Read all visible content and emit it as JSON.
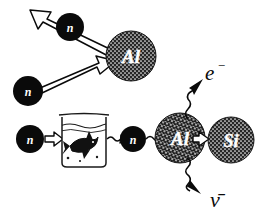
{
  "figure": {
    "background_color": "#ffffff",
    "ink_color": "#0a0a0a"
  },
  "palette": {
    "neutron_fill": "#0a0a0a",
    "neutron_label_color": "#ffffff",
    "nucleus_fill": "#2b2b2b",
    "nucleus_label_color": "#ffffff",
    "outline_arrow_fill": "#ffffff",
    "outline_arrow_stroke": "#0a0a0a",
    "wavy_arrow_color": "#0a0a0a",
    "beaker_stroke": "#1a1a1a"
  },
  "top_row": {
    "caption": "Neutron scattering off an aluminium nucleus",
    "incoming_neutron": {
      "label": "n",
      "x": 28,
      "y": 91,
      "r": 15
    },
    "outgoing_neutron": {
      "label": "n",
      "x": 70,
      "y": 27,
      "r": 14
    },
    "nucleus": {
      "label": "Al",
      "x": 131,
      "y": 56,
      "r": 25
    },
    "incoming_arrow": {
      "name": "neutron-in-arrow",
      "direction": "up-right"
    },
    "outgoing_arrow": {
      "name": "neutron-out-arrow",
      "direction": "up-left"
    }
  },
  "bottom_row": {
    "caption": "Moderated neutron captured by aluminium, beta decay to silicon",
    "source_neutron": {
      "label": "n",
      "x": 30,
      "y": 139,
      "r": 14
    },
    "moderated_neutron": {
      "label": "n",
      "x": 133,
      "y": 139,
      "r": 13
    },
    "moderator": {
      "name": "water-beaker",
      "label": "",
      "x": 60,
      "y": 113,
      "w": 48,
      "h": 55
    },
    "nucleus_before": {
      "label": "Al",
      "x": 180,
      "y": 138,
      "r": 25
    },
    "nucleus_after": {
      "label": "Si",
      "x": 231,
      "y": 140,
      "r": 23
    },
    "arrows": [
      {
        "name": "neutron-to-beaker-arrow",
        "style": "outline",
        "direction": "right"
      },
      {
        "name": "beaker-to-neutron-arrow",
        "style": "wavy-outline",
        "direction": "right"
      },
      {
        "name": "neutron-to-aluminium-arrow",
        "style": "wavy-outline",
        "direction": "right"
      },
      {
        "name": "aluminium-to-silicon-arrow",
        "style": "outline",
        "direction": "right"
      }
    ]
  },
  "decay_products": {
    "electron": {
      "label": "e",
      "superscript": "−",
      "x": 214,
      "y": 74
    },
    "antineutrino": {
      "label": "ν̄",
      "x": 219,
      "y": 198
    },
    "electron_arrow": {
      "name": "electron-emission-arrow",
      "style": "wavy",
      "direction": "up-right"
    },
    "antineutrino_arrow": {
      "name": "antineutrino-emission-arrow",
      "style": "wavy",
      "direction": "down-right"
    }
  }
}
